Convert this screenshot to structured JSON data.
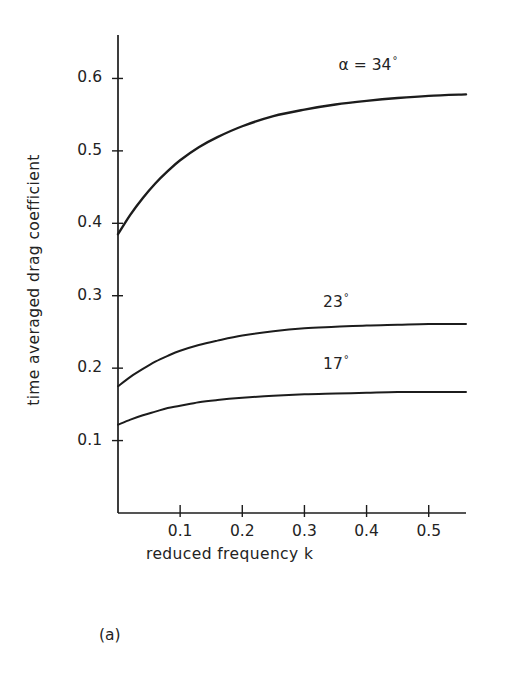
{
  "figure": {
    "caption": "(a)"
  },
  "chart_data": {
    "type": "line",
    "title": "",
    "xlabel": "reduced   frequency   k",
    "ylabel": "time  averaged   drag  coefficient",
    "xlim": [
      0.0,
      0.56
    ],
    "ylim": [
      0.0,
      0.66
    ],
    "grid": false,
    "legend_position": "inline-curve-labels",
    "xticks": [
      0.1,
      0.2,
      0.3,
      0.4,
      0.5
    ],
    "xtick_labels": [
      "0.1",
      "0.2",
      "0.3",
      "0.4",
      "0.5"
    ],
    "yticks": [
      0.1,
      0.2,
      0.3,
      0.4,
      0.5,
      0.6
    ],
    "ytick_labels": [
      "0.1",
      "0.2",
      "0.3",
      "0.4",
      "0.5",
      "0.6"
    ],
    "series": [
      {
        "name": "alpha = 34 deg",
        "label_prefix": "α = 34",
        "label_degree": "°",
        "label_x": 0.355,
        "label_y": 0.617,
        "x": [
          0.0,
          0.02,
          0.04,
          0.06,
          0.08,
          0.1,
          0.13,
          0.16,
          0.2,
          0.25,
          0.3,
          0.35,
          0.4,
          0.45,
          0.5,
          0.56
        ],
        "values": [
          0.385,
          0.412,
          0.435,
          0.455,
          0.472,
          0.487,
          0.505,
          0.519,
          0.534,
          0.548,
          0.557,
          0.564,
          0.569,
          0.573,
          0.576,
          0.578
        ]
      },
      {
        "name": "23 deg",
        "label_prefix": "23",
        "label_degree": "°",
        "label_x": 0.33,
        "label_y": 0.29,
        "x": [
          0.0,
          0.02,
          0.04,
          0.06,
          0.08,
          0.1,
          0.13,
          0.16,
          0.2,
          0.25,
          0.3,
          0.35,
          0.4,
          0.45,
          0.5,
          0.56
        ],
        "values": [
          0.175,
          0.188,
          0.199,
          0.209,
          0.217,
          0.224,
          0.232,
          0.238,
          0.245,
          0.251,
          0.255,
          0.257,
          0.259,
          0.26,
          0.261,
          0.261
        ]
      },
      {
        "name": "17 deg",
        "label_prefix": "17",
        "label_degree": "°",
        "label_x": 0.33,
        "label_y": 0.205,
        "x": [
          0.0,
          0.02,
          0.04,
          0.06,
          0.08,
          0.1,
          0.13,
          0.16,
          0.2,
          0.25,
          0.3,
          0.35,
          0.4,
          0.45,
          0.5,
          0.56
        ],
        "values": [
          0.122,
          0.129,
          0.135,
          0.14,
          0.145,
          0.148,
          0.153,
          0.156,
          0.159,
          0.162,
          0.164,
          0.165,
          0.166,
          0.167,
          0.167,
          0.167
        ]
      }
    ]
  },
  "colors": {
    "ink": "#1c1c1c",
    "background": "#ffffff"
  }
}
